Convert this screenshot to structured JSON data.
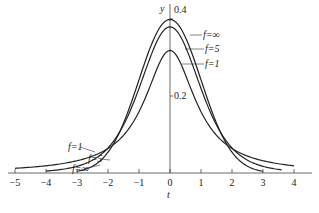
{
  "chart_data": {
    "type": "line",
    "title": "",
    "xlabel": "t",
    "ylabel": "y",
    "xlim": [
      -5,
      4
    ],
    "x_ticks": [
      -5,
      -4,
      -3,
      -2,
      -1,
      0,
      1,
      2,
      3,
      4
    ],
    "y_ticks": [
      0.2,
      0.4
    ],
    "grid": false,
    "legend_position": "inline annotations",
    "series": [
      {
        "name": "f=∞",
        "df": "inf",
        "x_range": [
          -3.0,
          3.0
        ],
        "peak": 0.399
      },
      {
        "name": "f=5",
        "df": 5,
        "x_range": [
          -4.0,
          3.6
        ],
        "peak": 0.38
      },
      {
        "name": "f=1",
        "df": 1,
        "x_range": [
          -5.0,
          4.0
        ],
        "peak": 0.318
      }
    ],
    "annotations": {
      "right": [
        "f=∞",
        "f=5",
        "f=1"
      ],
      "left": [
        "f=1",
        "f=5",
        "f=∞"
      ]
    }
  },
  "labels": {
    "y_axis": "y",
    "x_axis": "t",
    "y04": "0.4",
    "y02": "0.2",
    "r_inf": "f=∞",
    "r_5": "f=5",
    "r_1": "f=1",
    "l_1": "f=1",
    "l_5": "f=5",
    "l_inf": "f=∞"
  }
}
